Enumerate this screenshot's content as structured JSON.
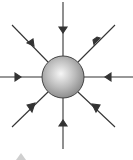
{
  "diagram": {
    "title": "",
    "charge": {
      "shape": "sphere",
      "cx": 63,
      "cy": 77,
      "r": 21,
      "color_light": "#f4f4f4",
      "color_dark": "#8a8a8a",
      "stroke": "#444444"
    },
    "field_lines": [
      {
        "direction": "top",
        "x1": 63,
        "y1": 2,
        "x2": 63,
        "y2": 56,
        "arrow_at": 30
      },
      {
        "direction": "top-right",
        "x1": 115,
        "y1": 25,
        "x2": 78,
        "y2": 62,
        "arrow_at": 96
      },
      {
        "direction": "right",
        "x1": 133,
        "y1": 77,
        "x2": 84,
        "y2": 77,
        "arrow_at": 108
      },
      {
        "direction": "bottom-right",
        "x1": 115,
        "y1": 127,
        "x2": 78,
        "y2": 92,
        "arrow_at": 97
      },
      {
        "direction": "bottom",
        "x1": 63,
        "y1": 149,
        "x2": 63,
        "y2": 98,
        "arrow_at": 123
      },
      {
        "direction": "bottom-left",
        "x1": 12,
        "y1": 127,
        "x2": 48,
        "y2": 92,
        "arrow_at": 30
      },
      {
        "direction": "left",
        "x1": 0,
        "y1": 77,
        "x2": 42,
        "y2": 77,
        "arrow_at": 18
      },
      {
        "direction": "top-left",
        "x1": 12,
        "y1": 25,
        "x2": 48,
        "y2": 62,
        "arrow_at": 30
      }
    ],
    "line_color": "#333333",
    "fragment_marker": {
      "shape": "triangle",
      "color": "#cfcfcf"
    }
  }
}
